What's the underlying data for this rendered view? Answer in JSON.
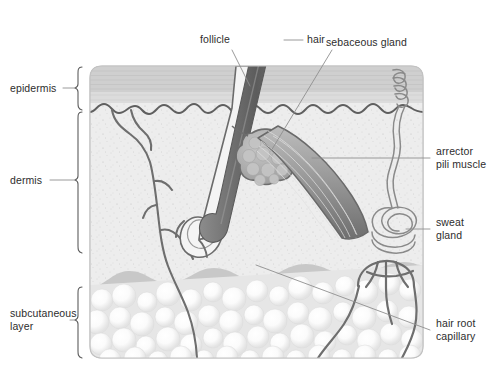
{
  "figure": {
    "type": "anatomical-diagram"
  },
  "layer_labels": [
    {
      "id": "epidermis",
      "text": "epidermis"
    },
    {
      "id": "dermis",
      "text": "dermis"
    },
    {
      "id": "subcutaneous-layer",
      "text": "subcutaneous\nlayer"
    }
  ],
  "structure_labels": [
    {
      "id": "follicle",
      "text": "follicle"
    },
    {
      "id": "hair",
      "text": "hair"
    },
    {
      "id": "sebaceous-gland",
      "text": "sebaceous gland"
    },
    {
      "id": "arrector-pili-muscle",
      "text": "arrector\npili muscle"
    },
    {
      "id": "sweat-gland",
      "text": "sweat\ngland"
    },
    {
      "id": "hair-root-capillary",
      "text": "hair root\ncapillary"
    }
  ],
  "colors": {
    "epidermis_top": "#cfcfcf",
    "epidermis_lower": "#dedede",
    "dermis": "#ececec",
    "dermis_deep": "#c7c7c7",
    "subcutaneous": "#e4e4e4",
    "fat_cell": "#fbfbfb",
    "outline": "#6b6b6b",
    "vessel": "#6e6e6e",
    "hair_shaft": "#7d7d7d",
    "hair_shaft_dark": "#5e5e5e",
    "muscle": "#8d8d8d",
    "gland": "#adadad",
    "leader_line": "#9a9a9a",
    "text": "#2d2d2d",
    "background": "#ffffff"
  }
}
